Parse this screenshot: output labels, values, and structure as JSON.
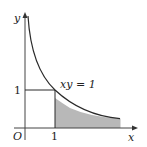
{
  "diagram": {
    "axes": {
      "x_label": "x",
      "y_label": "y",
      "origin_label": "O"
    },
    "ticks": {
      "x_tick": "1",
      "y_tick": "1"
    },
    "curve": {
      "equation_label": "xy = 1",
      "function": "y = 1/x"
    },
    "shaded_region": {
      "description": "area under y=1/x for x >= 1",
      "fill_color": "#b8b8b8"
    },
    "colors": {
      "line": "#2a2a2a",
      "axis": "#444444"
    }
  }
}
